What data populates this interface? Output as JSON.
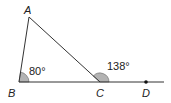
{
  "diagram": {
    "type": "triangle-exterior-angle",
    "points": {
      "A": {
        "label": "A"
      },
      "B": {
        "label": "B"
      },
      "C": {
        "label": "C"
      },
      "D": {
        "label": "D"
      }
    },
    "angles": {
      "B": {
        "label": "80°",
        "value": 80
      },
      "exterior_C": {
        "label": "138°",
        "value": 138
      }
    },
    "colors": {
      "line": "#333333",
      "angle_fill": "#b3b3b3"
    }
  }
}
